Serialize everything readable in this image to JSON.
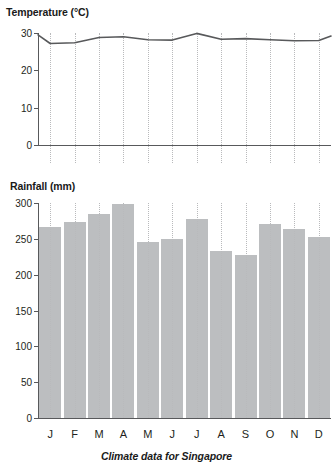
{
  "chart_data": [
    {
      "type": "line",
      "title": "Temperature (°C)",
      "xlabel": "",
      "ylabel": "Temperature (°C)",
      "categories": [
        "J",
        "F",
        "M",
        "A",
        "M",
        "J",
        "J",
        "A",
        "S",
        "O",
        "N",
        "D"
      ],
      "values": [
        27.2,
        27.4,
        28.8,
        29.0,
        28.2,
        28.1,
        29.9,
        28.3,
        28.5,
        28.2,
        27.9,
        28.0
      ],
      "edge_start_value": 29.5,
      "edge_end_value": 29.2,
      "ylim": [
        0,
        30
      ],
      "yticks": [
        0,
        10,
        20,
        30
      ],
      "ytick_labels": [
        "0",
        "10",
        "20",
        "30"
      ],
      "grid": "vertical-dotted",
      "legend": "none",
      "line_color": "#58595b"
    },
    {
      "type": "bar",
      "title": "Rainfall (mm)",
      "xlabel": "",
      "ylabel": "Rainfall (mm)",
      "categories": [
        "J",
        "F",
        "M",
        "A",
        "M",
        "J",
        "J",
        "A",
        "S",
        "O",
        "N",
        "D"
      ],
      "values": [
        267,
        274,
        285,
        298,
        245,
        250,
        277,
        233,
        227,
        271,
        264,
        252
      ],
      "ylim": [
        0,
        300
      ],
      "yticks": [
        0,
        50,
        100,
        150,
        200,
        250,
        300
      ],
      "ytick_labels": [
        "0",
        "50",
        "100",
        "150",
        "200",
        "250",
        "300"
      ],
      "grid": "vertical-dotted",
      "legend": "none",
      "bar_color": "#bcbec0"
    }
  ],
  "figure": {
    "caption": "Climate data for Singapore",
    "temperature_title": "Temperature (°C)",
    "rainfall_title": "Rainfall (mm)",
    "month_labels": [
      "J",
      "F",
      "M",
      "A",
      "M",
      "J",
      "J",
      "A",
      "S",
      "O",
      "N",
      "D"
    ],
    "temperature_tick_labels": [
      "30",
      "20",
      "10",
      "0"
    ],
    "rainfall_tick_labels": [
      "300",
      "250",
      "200",
      "150",
      "100",
      "50",
      "0"
    ],
    "colors": {
      "bar": "#bcbec0",
      "line": "#58595b",
      "axis": "#58595b",
      "grid": "#b9babc",
      "text": "#231f20",
      "background": "#ffffff"
    }
  }
}
